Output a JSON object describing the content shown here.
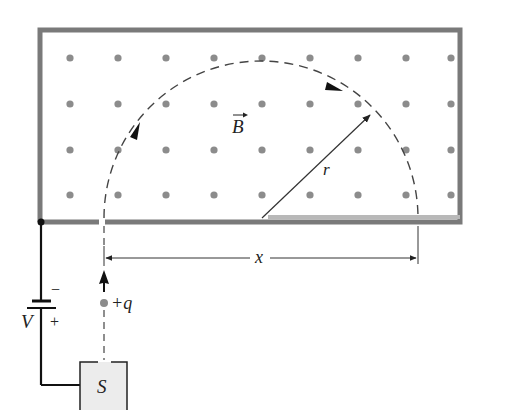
{
  "diagram": {
    "labels": {
      "field": "B",
      "radius": "r",
      "distance": "x",
      "charge": "+q",
      "voltage": "V",
      "battery_minus": "−",
      "battery_plus": "+",
      "source": "S"
    },
    "colors": {
      "wall": "#7a7a7a",
      "dot": "#8c8c8c",
      "detector": "#b8b8b8",
      "source_fill": "#ececec",
      "line": "#222222",
      "path": "#444444"
    },
    "field_dots": {
      "columns": [
        70,
        118,
        166,
        214,
        262,
        310,
        358,
        406,
        451
      ],
      "rows": [
        58,
        104,
        150,
        195
      ]
    }
  }
}
